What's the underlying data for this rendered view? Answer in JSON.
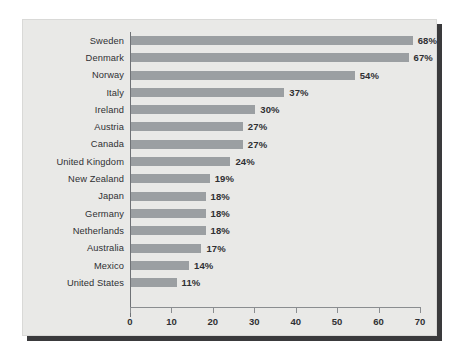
{
  "chart_data": {
    "type": "bar",
    "orientation": "horizontal",
    "title": "",
    "subtitle": "",
    "xlabel": "",
    "ylabel": "",
    "xlim": [
      0,
      70
    ],
    "xticks": [
      0,
      10,
      20,
      30,
      40,
      50,
      60,
      70
    ],
    "xtick_labels": [
      "0",
      "10",
      "20",
      "30",
      "40",
      "50",
      "60",
      "70"
    ],
    "grid": false,
    "legend": null,
    "value_suffix": "%",
    "categories": [
      "Sweden",
      "Denmark",
      "Norway",
      "Italy",
      "Ireland",
      "Austria",
      "Canada",
      "United Kingdom",
      "New Zealand",
      "Japan",
      "Germany",
      "Netherlands",
      "Australia",
      "Mexico",
      "United States"
    ],
    "values": [
      68,
      67,
      54,
      37,
      30,
      27,
      27,
      24,
      19,
      18,
      18,
      18,
      17,
      14,
      11
    ],
    "value_labels": [
      "68%",
      "67%",
      "54%",
      "37%",
      "30%",
      "27%",
      "27%",
      "24%",
      "19%",
      "18%",
      "18%",
      "18%",
      "17%",
      "14%",
      "11%"
    ],
    "series": [
      {
        "name": "",
        "values": [
          68,
          67,
          54,
          37,
          30,
          27,
          27,
          24,
          19,
          18,
          18,
          18,
          17,
          14,
          11
        ]
      }
    ],
    "colors": {
      "bar": "#9b9fa2",
      "panel_background": "#e9e9e7",
      "page_background": "#ffffff",
      "text": "#2f3033",
      "axis": "#8a8d90",
      "shadow": "#3a3a3c"
    }
  }
}
